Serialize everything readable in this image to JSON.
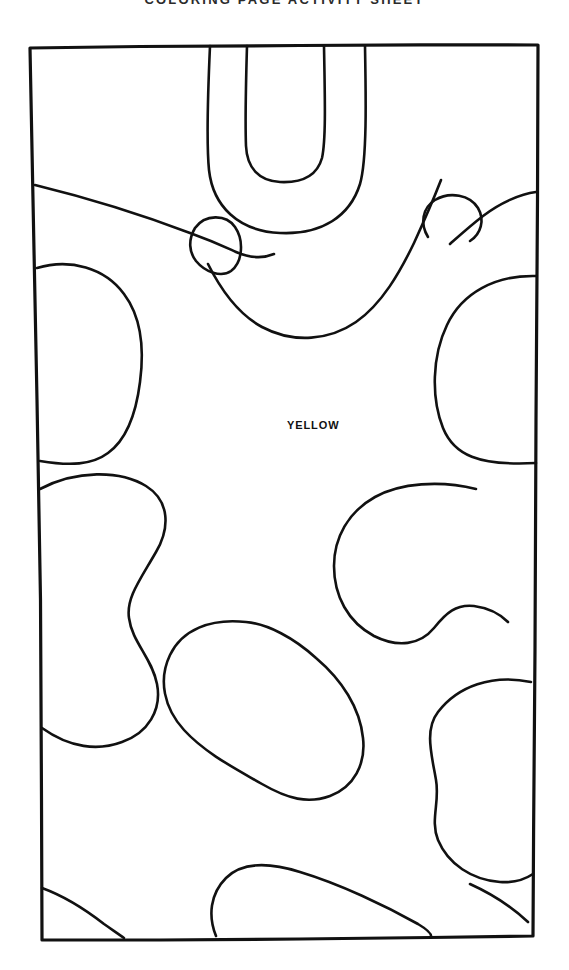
{
  "document": {
    "kind": "coloring-page",
    "title": "COLORING PAGE ACTIVITY SHEET",
    "background_color": "#ffffff",
    "ink_color": "#111111",
    "width": 569,
    "height": 970
  },
  "frame": {
    "name": "drawing-border",
    "top_left": [
      30,
      48
    ],
    "top_right": [
      538,
      45
    ],
    "bottom_right": [
      533,
      936
    ],
    "bottom_left": [
      42,
      940
    ],
    "stroke_width": 3
  },
  "labels": [
    {
      "id": "yellow",
      "text": "YELLOW",
      "color_name": "YELLOW",
      "swatch_hex": "#ffd500",
      "x": 287,
      "y": 419,
      "font_size": 11,
      "bold": true
    }
  ],
  "shapes": [
    {
      "id": "u-inner",
      "name": "inner-u-shape",
      "note": "nested U hanging from top edge"
    },
    {
      "id": "u-outer",
      "name": "outer-u-shape",
      "note": "nested U hanging from top edge"
    },
    {
      "id": "teardrop-left",
      "name": "teardrop-blob",
      "note": "small leaf shape upper-left-center"
    },
    {
      "id": "sweep-left",
      "name": "left-sweep-curve",
      "note": "long curve from left border to center"
    },
    {
      "id": "circle-right",
      "name": "small-circle-blob",
      "note": "small circle upper right"
    },
    {
      "id": "dblob-left",
      "name": "left-d-blob",
      "note": "D shape on left border"
    },
    {
      "id": "oval-right",
      "name": "right-oval-blob",
      "note": "large oval on right border"
    },
    {
      "id": "peanut-left",
      "name": "left-peanut-blob",
      "note": "hourglass blob on left border"
    },
    {
      "id": "bean-right",
      "name": "right-bean-blob",
      "note": "kidney bean center right"
    },
    {
      "id": "bean-center",
      "name": "center-bean-blob",
      "note": "large tilted bean lower center"
    },
    {
      "id": "lump-right",
      "name": "right-lumpy-blob",
      "note": "tall lumpy blob on right border"
    },
    {
      "id": "wedge-bottom",
      "name": "bottom-wedge-blob",
      "note": "fin shape on bottom border"
    },
    {
      "id": "corner-bottom-left",
      "name": "bottom-left-corner-blob",
      "note": "curve clipping lower-left corner"
    }
  ],
  "toolbar": {
    "note": "static printable artwork; no interactive controls present"
  }
}
